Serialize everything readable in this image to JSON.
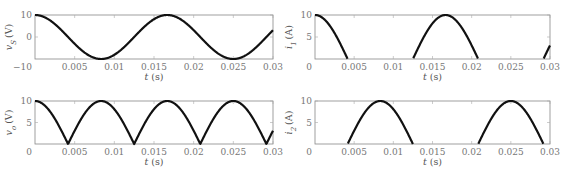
{
  "chart_data": [
    {
      "id": "vs",
      "type": "line",
      "ylabel_var": "v",
      "ylabel_sub": "S",
      "ylabel_unit": "(V)",
      "xlabel_var": "t",
      "xlabel_unit": "(s)",
      "xlim": [
        0,
        0.03
      ],
      "ylim": [
        -10,
        10
      ],
      "xticks": [
        0.005,
        0.01,
        0.015,
        0.02,
        0.025,
        0.03
      ],
      "xtick_labels": [
        "0.005",
        "0.01",
        "0.015",
        "0.02",
        "0.025",
        "0.03"
      ],
      "x_origin_label": "-10",
      "yticks": [
        10,
        0
      ],
      "ytick_labels": [
        "10",
        "0"
      ],
      "function": "10*cos(2*pi*60*t)",
      "amplitude": 10,
      "frequency_hz": 60,
      "mode": "full"
    },
    {
      "id": "i1",
      "type": "line",
      "ylabel_var": "i",
      "ylabel_sub": "1",
      "ylabel_unit": "(A)",
      "xlabel_var": "t",
      "xlabel_unit": "(s)",
      "xlim": [
        0,
        0.03
      ],
      "ylim": [
        0,
        10
      ],
      "xticks": [
        0.005,
        0.01,
        0.015,
        0.02,
        0.025,
        0.03
      ],
      "xtick_labels": [
        "0.005",
        "0.01",
        "0.015",
        "0.02",
        "0.025",
        "0.03"
      ],
      "x_origin_label": "0",
      "yticks": [
        10,
        5
      ],
      "ytick_labels": [
        "10",
        "5"
      ],
      "function": "max(10*cos(2*pi*60*t), 0)",
      "amplitude": 10,
      "frequency_hz": 60,
      "mode": "positive"
    },
    {
      "id": "vo",
      "type": "line",
      "ylabel_var": "v",
      "ylabel_sub": "o",
      "ylabel_unit": "(V)",
      "xlabel_var": "t",
      "xlabel_unit": "(s)",
      "xlim": [
        0,
        0.03
      ],
      "ylim": [
        0,
        10
      ],
      "xticks": [
        0.005,
        0.01,
        0.015,
        0.02,
        0.025,
        0.03
      ],
      "xtick_labels": [
        "0.005",
        "0.01",
        "0.015",
        "0.02",
        "0.025",
        "0.03"
      ],
      "x_origin_label": "0",
      "yticks": [
        10,
        5
      ],
      "ytick_labels": [
        "10",
        "5"
      ],
      "function": "abs(10*cos(2*pi*60*t))",
      "amplitude": 10,
      "frequency_hz": 60,
      "mode": "abs"
    },
    {
      "id": "i2",
      "type": "line",
      "ylabel_var": "i",
      "ylabel_sub": "2",
      "ylabel_unit": "(A)",
      "xlabel_var": "t",
      "xlabel_unit": "(s)",
      "xlim": [
        0,
        0.03
      ],
      "ylim": [
        0,
        10
      ],
      "xticks": [
        0.005,
        0.01,
        0.015,
        0.02,
        0.025,
        0.03
      ],
      "xtick_labels": [
        "0.005",
        "0.01",
        "0.015",
        "0.02",
        "0.025",
        "0.03"
      ],
      "x_origin_label": "0",
      "yticks": [
        10,
        5
      ],
      "ytick_labels": [
        "10",
        "5"
      ],
      "function": "max(-10*cos(2*pi*60*t), 0)",
      "amplitude": 10,
      "frequency_hz": 60,
      "mode": "negative"
    }
  ]
}
